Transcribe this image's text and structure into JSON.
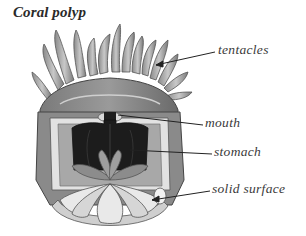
{
  "diagram": {
    "title": "Coral polyp",
    "labels": [
      {
        "id": "tentacles",
        "text": "tentacles"
      },
      {
        "id": "mouth",
        "text": "mouth"
      },
      {
        "id": "stomach",
        "text": "stomach"
      },
      {
        "id": "solid_surface",
        "text": "solid surface"
      }
    ],
    "colors": {
      "body_dark": "#6e6e6e",
      "body_mid": "#9a9a9a",
      "body_light": "#d4d4d4",
      "stomach": "#1c1c1c",
      "leader_line": "#222222",
      "text": "#3a3a3a"
    }
  }
}
